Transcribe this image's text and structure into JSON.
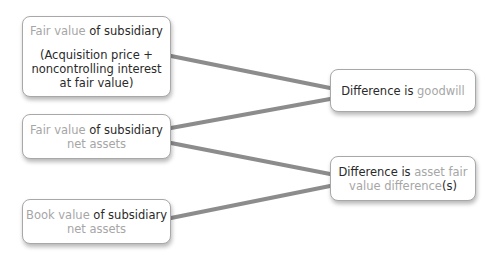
{
  "left_boxes": [
    {
      "line1_light": "Fair value",
      "line1_dark": " of subsidiary",
      "detail_lines": [
        "(Acquisition price +",
        "noncontrolling interest",
        "at fair value)"
      ]
    },
    {
      "line1_light": "Fair value",
      "line1_dark": " of subsidiary",
      "line2_light": "net assets"
    },
    {
      "line1_light": "Book value",
      "line1_dark": " of subsidiary",
      "line2_light": "net assets"
    }
  ],
  "right_boxes": [
    {
      "line1_dark": "Difference is ",
      "line1_light": "goodwill"
    },
    {
      "line1_dark": "Difference is ",
      "line1_light": "asset fair",
      "line2_light": "value difference",
      "line2_dark": "(s)"
    }
  ],
  "colors": {
    "connector": "#8a8a8a",
    "border": "#a8a8a8",
    "muted_text": "#a6a6a6",
    "dark_text": "#2a2a2a"
  }
}
